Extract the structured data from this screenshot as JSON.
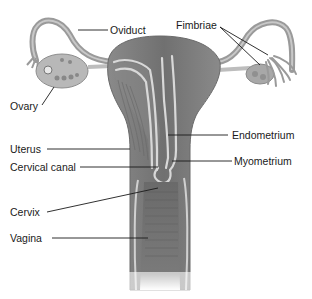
{
  "diagram": {
    "labels": [
      {
        "id": "oviduct",
        "text": "Oviduct"
      },
      {
        "id": "fimbriae",
        "text": "Fimbriae"
      },
      {
        "id": "ovary",
        "text": "Ovary"
      },
      {
        "id": "uterus",
        "text": "Uterus"
      },
      {
        "id": "endometrium",
        "text": "Endometrium"
      },
      {
        "id": "cervical_canal",
        "text": "Cervical canal"
      },
      {
        "id": "myometrium",
        "text": "Myometrium"
      },
      {
        "id": "cervix",
        "text": "Cervix"
      },
      {
        "id": "vagina",
        "text": "Vagina"
      }
    ],
    "colors": {
      "tissue_dark": "#6e6e6e",
      "tissue_mid": "#8c8c8c",
      "tissue_light": "#b4b4b4",
      "membrane": "#d8d8d8",
      "leader_line": "#1a1a1a",
      "background": "#ffffff"
    }
  }
}
